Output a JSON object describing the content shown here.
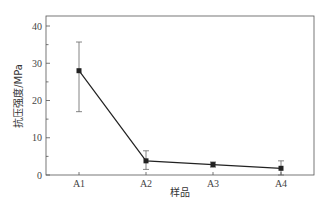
{
  "chart_data": {
    "type": "line",
    "title": "",
    "xlabel": "样品",
    "ylabel": "抗压强度/MPa",
    "categories": [
      "A1",
      "A2",
      "A3",
      "A4"
    ],
    "series": [
      {
        "name": "抗压强度",
        "values": [
          28.0,
          3.8,
          2.8,
          1.8
        ],
        "error_upper": [
          35.7,
          6.5,
          3.5,
          3.8
        ],
        "error_lower": [
          17.0,
          1.5,
          2.1,
          0.0
        ],
        "marker": "square",
        "color": "#222222"
      }
    ],
    "ylim": [
      0,
      43
    ],
    "yticks": [
      0,
      10,
      20,
      30,
      40
    ],
    "grid": false,
    "legend": null
  }
}
